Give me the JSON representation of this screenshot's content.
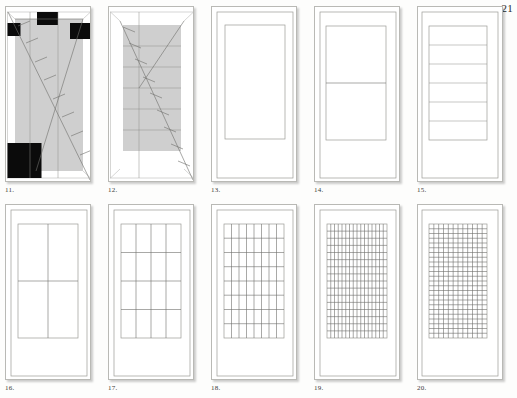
{
  "page": {
    "number": "21",
    "background_color": "#fdfdfc",
    "paper_color": "#ffffff",
    "line_color": "#8d8d89",
    "shade_color": "#cfcfcf",
    "black_color": "#0b0b0b"
  },
  "figures": [
    {
      "caption": "11.",
      "type": "proportion-diagram-diagonal",
      "description": "Vertical panel with gray shaded central field, full diagonal from upper-left to lower-right with tick marks, and four solid black squares at corners",
      "has_diagonal": true,
      "has_black_squares": true,
      "black_square_count": 4,
      "shaded": true,
      "vertical_divisions": 2,
      "horizontal_divisions": 0,
      "tick_count": 7
    },
    {
      "caption": "12.",
      "type": "proportion-diagram-diagonal",
      "description": "Vertical panel with gray shaded central field divided into six horizontal bands, crossing diagonals with tick marks",
      "has_diagonal": true,
      "has_black_squares": false,
      "black_square_count": 0,
      "shaded": true,
      "vertical_divisions": 1,
      "horizontal_divisions": 6,
      "tick_count": 8
    },
    {
      "caption": "13.",
      "type": "plain-panel",
      "description": "Vertical panel with single undivided inner rectangle",
      "has_diagonal": false,
      "has_black_squares": false,
      "shaded": false,
      "columns": 1,
      "rows": 1
    },
    {
      "caption": "14.",
      "type": "divided-panel",
      "description": "Vertical panel with inner rectangle split into two horizontal halves",
      "has_diagonal": false,
      "has_black_squares": false,
      "shaded": false,
      "columns": 1,
      "rows": 2
    },
    {
      "caption": "15.",
      "type": "divided-panel",
      "description": "Vertical panel with inner rectangle split into six horizontal bands",
      "has_diagonal": false,
      "has_black_squares": false,
      "shaded": false,
      "columns": 1,
      "rows": 6
    },
    {
      "caption": "16.",
      "type": "grid-panel",
      "description": "Vertical panel with inner rectangle split into a two by two grid",
      "has_diagonal": false,
      "shaded": false,
      "columns": 2,
      "rows": 2
    },
    {
      "caption": "17.",
      "type": "grid-panel",
      "description": "Vertical panel with inner rectangle split into a four by four grid",
      "has_diagonal": false,
      "shaded": false,
      "columns": 4,
      "rows": 4
    },
    {
      "caption": "18.",
      "type": "grid-panel",
      "description": "Vertical panel with inner rectangle split into an eight by eight grid",
      "has_diagonal": false,
      "shaded": false,
      "columns": 8,
      "rows": 8
    },
    {
      "caption": "19.",
      "type": "grid-panel",
      "description": "Vertical panel with inner rectangle split into a fine sixteen by sixteen grid",
      "has_diagonal": false,
      "shaded": false,
      "columns": 16,
      "rows": 16
    },
    {
      "caption": "20.",
      "type": "grid-panel",
      "description": "Vertical panel with inner rectangle split into a fine twelve by twenty four grid",
      "has_diagonal": false,
      "shaded": false,
      "columns": 12,
      "rows": 24
    }
  ]
}
